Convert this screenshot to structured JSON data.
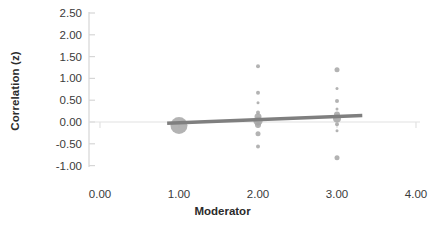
{
  "chart_data": {
    "type": "scatter",
    "title": "",
    "xlabel": "Moderator",
    "ylabel": "Correlation (z)",
    "xlim": [
      0.0,
      4.0
    ],
    "ylim": [
      -1.0,
      2.5
    ],
    "xticks": [
      "0.00",
      "1.00",
      "2.00",
      "3.00",
      "4.00"
    ],
    "xtick_values": [
      0.0,
      1.0,
      2.0,
      3.0,
      4.0
    ],
    "yticks": [
      "2.50",
      "2.00",
      "1.50",
      "1.00",
      "0.50",
      "0.00",
      "-0.50",
      "-1.00"
    ],
    "ytick_values": [
      2.5,
      2.0,
      1.5,
      1.0,
      0.5,
      0.0,
      -0.5,
      -1.0
    ],
    "grid": false,
    "zero_line": true,
    "legend": "none",
    "marker_color": "#a6a6a6",
    "trendline_color": "#7f7f7f",
    "axis_color": "#d9d9d9",
    "bubble_note": "marker area proportional to study weight",
    "points": [
      {
        "x": 1.0,
        "y": -0.08,
        "size": 17
      },
      {
        "x": 2.0,
        "y": 1.28,
        "size": 4
      },
      {
        "x": 2.0,
        "y": 0.67,
        "size": 4
      },
      {
        "x": 2.0,
        "y": 0.44,
        "size": 3
      },
      {
        "x": 2.0,
        "y": 0.22,
        "size": 4
      },
      {
        "x": 2.0,
        "y": 0.12,
        "size": 7
      },
      {
        "x": 2.0,
        "y": 0.02,
        "size": 9
      },
      {
        "x": 2.0,
        "y": -0.07,
        "size": 6
      },
      {
        "x": 2.0,
        "y": -0.27,
        "size": 5
      },
      {
        "x": 2.0,
        "y": -0.56,
        "size": 4
      },
      {
        "x": 3.0,
        "y": 1.2,
        "size": 5
      },
      {
        "x": 3.0,
        "y": 0.77,
        "size": 3
      },
      {
        "x": 3.0,
        "y": 0.48,
        "size": 4
      },
      {
        "x": 3.0,
        "y": 0.3,
        "size": 3
      },
      {
        "x": 3.0,
        "y": 0.17,
        "size": 6
      },
      {
        "x": 3.0,
        "y": 0.08,
        "size": 8
      },
      {
        "x": 3.0,
        "y": -0.05,
        "size": 4
      },
      {
        "x": 3.0,
        "y": -0.2,
        "size": 3
      },
      {
        "x": 3.0,
        "y": -0.82,
        "size": 5
      }
    ],
    "trendline": {
      "x_start": 0.85,
      "y_start": -0.03,
      "x_end": 3.32,
      "y_end": 0.15
    }
  }
}
